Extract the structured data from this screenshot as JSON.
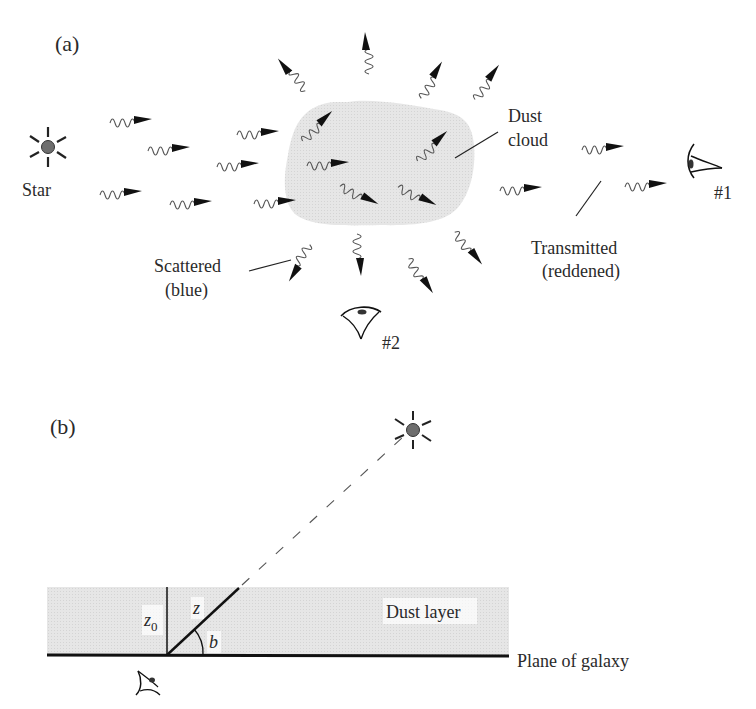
{
  "panel_a": {
    "label": "(a)",
    "star_label": "Star",
    "dust_cloud_label_line1": "Dust",
    "dust_cloud_label_line2": "cloud",
    "scattered_label_line1": "Scattered",
    "scattered_label_line2": "(blue)",
    "transmitted_label_line1": "Transmitted",
    "transmitted_label_line2": "(reddened)",
    "observer1_label": "#1",
    "observer2_label": "#2",
    "photons": [
      {
        "x": 110,
        "y": 119,
        "angle": 0
      },
      {
        "x": 148,
        "y": 147,
        "angle": 0
      },
      {
        "x": 100,
        "y": 191,
        "angle": 0
      },
      {
        "x": 170,
        "y": 201,
        "angle": 0
      },
      {
        "x": 237,
        "y": 131,
        "angle": 0
      },
      {
        "x": 217,
        "y": 163,
        "angle": 0
      },
      {
        "x": 254,
        "y": 200,
        "angle": 0
      },
      {
        "x": 307,
        "y": 162,
        "angle": 0
      },
      {
        "x": 300,
        "y": 138,
        "angle": -40
      },
      {
        "x": 342,
        "y": 183,
        "angle": 30
      },
      {
        "x": 400,
        "y": 184,
        "angle": 30
      },
      {
        "x": 415,
        "y": 158,
        "angle": -40
      },
      {
        "x": 302,
        "y": 93,
        "angle": -125
      },
      {
        "x": 365,
        "y": 74,
        "angle": -90
      },
      {
        "x": 418,
        "y": 96,
        "angle": -55
      },
      {
        "x": 472,
        "y": 97,
        "angle": -50
      },
      {
        "x": 500,
        "y": 187,
        "angle": 0
      },
      {
        "x": 582,
        "y": 146,
        "angle": 0
      },
      {
        "x": 625,
        "y": 183,
        "angle": 0
      },
      {
        "x": 313,
        "y": 247,
        "angle": 125
      },
      {
        "x": 361,
        "y": 234,
        "angle": 90
      },
      {
        "x": 412,
        "y": 257,
        "angle": 60
      },
      {
        "x": 458,
        "y": 230,
        "angle": 55
      }
    ]
  },
  "panel_b": {
    "label": "(b)",
    "dust_layer_label": "Dust layer",
    "plane_label": "Plane of galaxy",
    "z0_label": "z",
    "z0_subscript": "0",
    "z_label": "z",
    "b_label": "b"
  },
  "colors": {
    "dust_fill": "#e4e4e4",
    "ink": "#1a1a1a",
    "star_core": "#707070"
  }
}
